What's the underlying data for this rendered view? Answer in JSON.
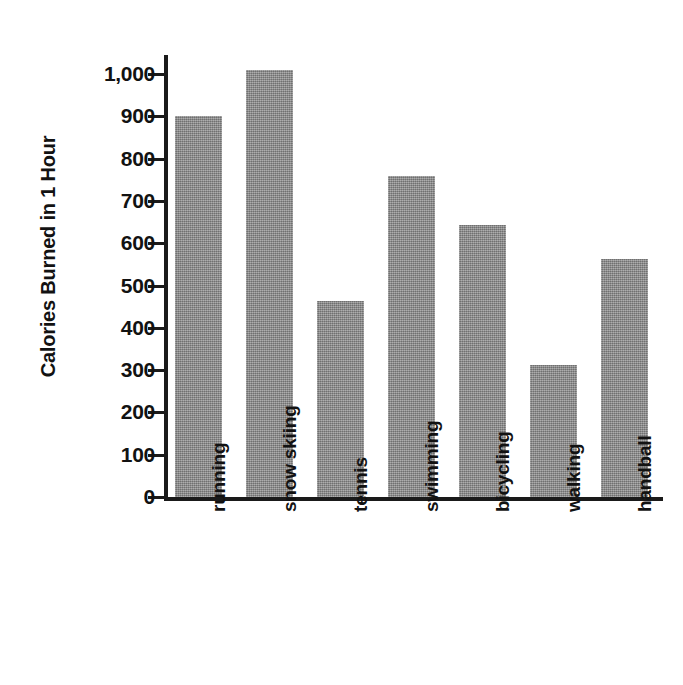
{
  "chart_data": {
    "type": "bar",
    "title": "",
    "xlabel": "",
    "ylabel": "Calories Burned in 1 Hour",
    "categories": [
      "running",
      "snow skiing",
      "tennis",
      "swimming",
      "bicycling",
      "walking",
      "handball"
    ],
    "values": [
      900,
      1010,
      463,
      760,
      643,
      312,
      562
    ],
    "ylim": [
      0,
      1000
    ],
    "y_ticks": [
      0,
      100,
      200,
      300,
      400,
      500,
      600,
      700,
      800,
      900,
      1000
    ],
    "y_tick_labels": [
      "0",
      "100",
      "200",
      "300",
      "400",
      "500",
      "600",
      "700",
      "800",
      "900",
      "1,000"
    ],
    "grid": false,
    "legend": null,
    "bar_color": "#8d8d8d",
    "axis_color": "#1a1a1a",
    "background_color": "#ffffff"
  }
}
